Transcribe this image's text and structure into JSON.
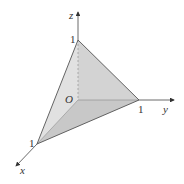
{
  "diagram": {
    "axes": {
      "x": {
        "label": "x",
        "tick": "1"
      },
      "y": {
        "label": "y",
        "tick": "1"
      },
      "z": {
        "label": "z",
        "tick": "1"
      }
    },
    "origin_label": "O",
    "colors": {
      "front_face": "#e9e9e9",
      "back_face": "#c8c8c8",
      "bottom_face": "#b5b5b5",
      "edge": "#555555",
      "axis": "#444444"
    }
  }
}
